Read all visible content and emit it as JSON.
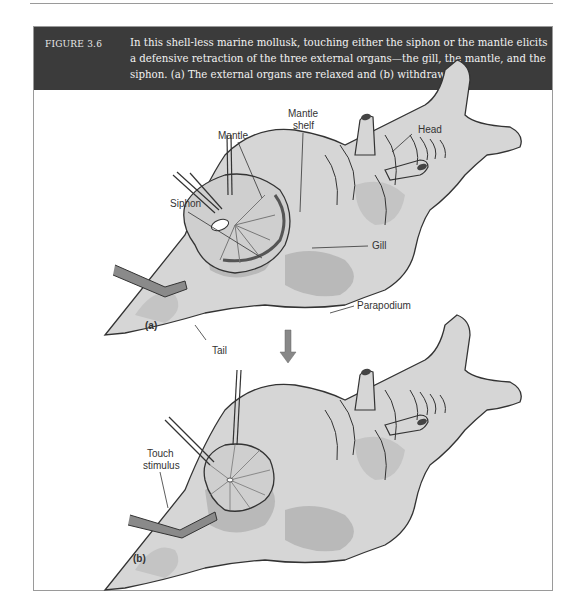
{
  "figure": {
    "number": "FIGURE 3.6",
    "caption": "In this shell-less marine mollusk, touching either the siphon or the mantle elicits a defensive retraction of the three external organs—the gill, the mantle, and the siphon. (a) The external organs are relaxed and (b) withdrawn",
    "colors": {
      "header_bg": "#3b3b3b",
      "header_text": "#f2f2f2",
      "body_fill": "#d6d6d6",
      "body_patch": "#b9b9b9",
      "outline": "#333333"
    }
  },
  "panel_a": {
    "panel_label": "(a)",
    "labels": {
      "mantle": "Mantle",
      "mantle_shelf_line1": "Mantle",
      "mantle_shelf_line2": "shelf",
      "head": "Head",
      "siphon": "Siphon",
      "gill": "Gill",
      "parapodium": "Parapodium",
      "tail": "Tail"
    }
  },
  "panel_b": {
    "panel_label": "(b)",
    "labels": {
      "touch_line1": "Touch",
      "touch_line2": "stimulus"
    }
  }
}
